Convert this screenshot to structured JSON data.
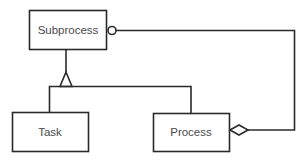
{
  "diagram": {
    "type": "entity-relationship",
    "nodes": [
      {
        "id": "subprocess",
        "label": "Subprocess"
      },
      {
        "id": "task",
        "label": "Task"
      },
      {
        "id": "process",
        "label": "Process"
      }
    ],
    "edges": [
      {
        "from": "subprocess",
        "to": "task",
        "type": "inheritance-fork",
        "marker": "triangle-open"
      },
      {
        "from": "subprocess",
        "to": "process",
        "type": "inheritance-fork",
        "marker": "triangle-open"
      },
      {
        "from": "process",
        "to": "subprocess",
        "type": "aggregation",
        "source_marker": "diamond-open",
        "target_marker": "circle-open"
      }
    ],
    "colors": {
      "line": "#2a2a2a",
      "text": "#4a4a4a",
      "background": "#ffffff"
    }
  }
}
